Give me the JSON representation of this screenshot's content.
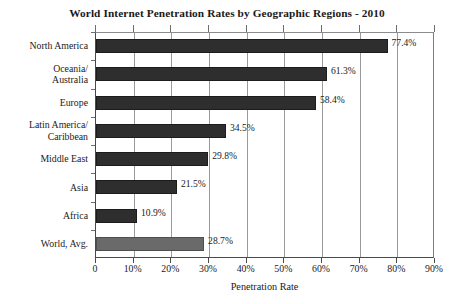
{
  "chart_data": {
    "type": "bar",
    "orientation": "horizontal",
    "title": "World Internet Penetration Rates by Geographic Regions - 2010",
    "xlabel": "Penetration Rate",
    "ylabel": "",
    "xlim": [
      0,
      90
    ],
    "grid": true,
    "legend": "none",
    "categories": [
      "North America",
      "Oceania/ Australia",
      "Europe",
      "Latin America/ Caribbean",
      "Middle East",
      "Asia",
      "Africa",
      "World, Avg."
    ],
    "category_lines": [
      [
        "North America"
      ],
      [
        "Oceania/",
        "Australia"
      ],
      [
        "Europe"
      ],
      [
        "Latin America/",
        "Caribbean"
      ],
      [
        "Middle East"
      ],
      [
        "Asia"
      ],
      [
        "Africa"
      ],
      [
        "World, Avg."
      ]
    ],
    "values": [
      77.4,
      61.3,
      58.4,
      34.5,
      29.8,
      21.5,
      10.9,
      28.7
    ],
    "value_labels": [
      "77.4%",
      "61.3%",
      "58.4%",
      "34.5%",
      "29.8%",
      "21.5%",
      "10.9%",
      "28.7%"
    ],
    "bar_colors": [
      "#2e2e2e",
      "#2e2e2e",
      "#2e2e2e",
      "#2e2e2e",
      "#2e2e2e",
      "#2e2e2e",
      "#2e2e2e",
      "#6a6a6a"
    ],
    "xticks": [
      0,
      10,
      20,
      30,
      40,
      50,
      60,
      70,
      80,
      90
    ],
    "xticklabels": [
      "0",
      "10%",
      "20%",
      "30%",
      "40%",
      "50%",
      "60%",
      "70%",
      "80%",
      "90%"
    ],
    "colors": {
      "bar_dark": "#2e2e2e",
      "bar_light": "#6a6a6a",
      "grid": "#9a9a9a",
      "axis": "#4a4a4a",
      "background": "#ffffff",
      "text": "#1a1a1a"
    }
  }
}
